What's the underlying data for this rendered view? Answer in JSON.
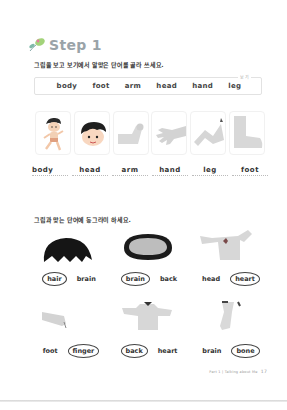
{
  "header": {
    "step_title": "Step 1",
    "icon": "leaf-sprout-icon"
  },
  "section1": {
    "instruction": "그림을 보고 보기에서 알맞은 단어를 골라 쓰세요.",
    "word_box_tag": "보기",
    "word_bank": [
      "body",
      "foot",
      "arm",
      "head",
      "hand",
      "leg"
    ],
    "pictures": [
      {
        "icon": "running-boy-icon",
        "answer": "body"
      },
      {
        "icon": "boy-head-icon",
        "answer": "head"
      },
      {
        "icon": "arm-icon",
        "answer": "arm"
      },
      {
        "icon": "hand-icon",
        "answer": "hand"
      },
      {
        "icon": "leg-icon",
        "answer": "leg"
      },
      {
        "icon": "foot-icon",
        "answer": "foot"
      }
    ]
  },
  "section2": {
    "instruction": "그림과 맞는 단어에 동그라미 하세요.",
    "items": [
      {
        "icon": "hair-icon",
        "options": [
          "hair",
          "brain"
        ],
        "circled": 0
      },
      {
        "icon": "brain-icon",
        "options": [
          "brain",
          "back"
        ],
        "circled": 0
      },
      {
        "icon": "heart-chest-icon",
        "options": [
          "head",
          "heart"
        ],
        "circled": 1
      },
      {
        "icon": "finger-icon",
        "options": [
          "foot",
          "finger"
        ],
        "circled": 1
      },
      {
        "icon": "back-icon",
        "options": [
          "back",
          "heart"
        ],
        "circled": 0
      },
      {
        "icon": "bone-leg-icon",
        "options": [
          "brain",
          "bone"
        ],
        "circled": 1
      }
    ]
  },
  "footer": {
    "label": "Part 1 | Talking about Me",
    "page_number": "17"
  },
  "colors": {
    "step_title": "#9aa3a8",
    "leaf_green": "#8bc34a",
    "leaf_pink": "#e57aa0",
    "picture_gray": "#cfcfcf"
  }
}
